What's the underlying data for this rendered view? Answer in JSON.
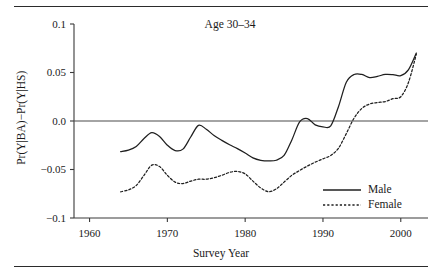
{
  "chart_data": {
    "type": "line",
    "title": "Age 30–34",
    "xlabel": "Survey Year",
    "ylabel": "Pr(Y|BA)−Pr(Y|HS)",
    "xlim": [
      1958,
      2003.5
    ],
    "ylim": [
      -0.1,
      0.1
    ],
    "xticks": [
      1960,
      1970,
      1980,
      1990,
      2000
    ],
    "xtick_labels": [
      "1960",
      "1970",
      "1980",
      "1990",
      "2000"
    ],
    "yticks": [
      -0.1,
      -0.05,
      0.0,
      0.05,
      0.1
    ],
    "ytick_labels": [
      "−0.1",
      "−0.05",
      "0.0",
      "0.05",
      "0.1"
    ],
    "grid": false,
    "zero_reference_line": true,
    "legend_position": "lower-right",
    "series": [
      {
        "name": "Male",
        "style": "solid",
        "color": "#1f1f1f",
        "x": [
          1964,
          1965,
          1966,
          1967,
          1968,
          1969,
          1970,
          1971,
          1972,
          1973,
          1974,
          1975,
          1976,
          1977,
          1978,
          1979,
          1980,
          1981,
          1982,
          1983,
          1984,
          1985,
          1986,
          1987,
          1988,
          1989,
          1990,
          1991,
          1992,
          1993,
          1994,
          1995,
          1996,
          1997,
          1998,
          1999,
          2000,
          2001,
          2002
        ],
        "values": [
          -0.0315,
          -0.03,
          -0.0262,
          -0.018,
          -0.012,
          -0.016,
          -0.025,
          -0.0305,
          -0.029,
          -0.0165,
          -0.0045,
          -0.0085,
          -0.015,
          -0.02,
          -0.0245,
          -0.0285,
          -0.033,
          -0.038,
          -0.0405,
          -0.0412,
          -0.0405,
          -0.0355,
          -0.0195,
          -0.001,
          0.0025,
          -0.004,
          -0.006,
          -0.005,
          0.015,
          0.04,
          0.048,
          0.048,
          0.0448,
          0.046,
          0.048,
          0.0478,
          0.0468,
          0.053,
          0.07
        ]
      },
      {
        "name": "Female",
        "style": "dotted",
        "color": "#1f1f1f",
        "x": [
          1964,
          1965,
          1966,
          1967,
          1968,
          1969,
          1970,
          1971,
          1972,
          1973,
          1974,
          1975,
          1976,
          1977,
          1978,
          1979,
          1980,
          1981,
          1982,
          1983,
          1984,
          1985,
          1986,
          1987,
          1988,
          1989,
          1990,
          1991,
          1992,
          1993,
          1994,
          1995,
          1996,
          1997,
          1998,
          1999,
          2000,
          2001,
          2002
        ],
        "values": [
          -0.073,
          -0.071,
          -0.0665,
          -0.056,
          -0.0455,
          -0.047,
          -0.056,
          -0.063,
          -0.0645,
          -0.062,
          -0.06,
          -0.06,
          -0.0585,
          -0.056,
          -0.053,
          -0.052,
          -0.0545,
          -0.062,
          -0.069,
          -0.0728,
          -0.07,
          -0.063,
          -0.056,
          -0.051,
          -0.0465,
          -0.0425,
          -0.039,
          -0.0355,
          -0.028,
          -0.013,
          0.003,
          0.013,
          0.0175,
          0.019,
          0.02,
          0.023,
          0.025,
          0.04,
          0.069
        ]
      }
    ]
  }
}
